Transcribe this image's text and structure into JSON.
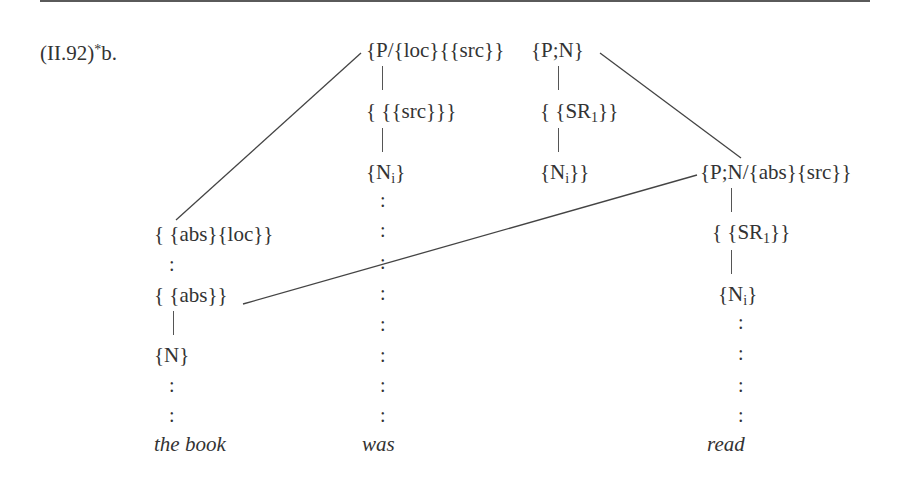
{
  "example": {
    "number": "(II.92)",
    "star": "*",
    "letter": "b."
  },
  "nodes": {
    "top_left": "{P/{loc}{{src}}",
    "top_right": "{P;N}",
    "was_mid": "{ {{src}}}",
    "was_low_base": "{N",
    "was_low_sub": "i",
    "was_low_close": "}",
    "pn_mid_base": "{ {SR",
    "pn_mid_sub": "1",
    "pn_mid_close": "}}",
    "pn_low_base": "{N",
    "pn_low_sub": "i",
    "pn_low_close": "}}",
    "read_top": "{P;N/{abs}{src}}",
    "read_mid_base": "{ {SR",
    "read_mid_sub": "1",
    "read_mid_close": "}}",
    "read_low_base": "{N",
    "read_low_sub": "i",
    "read_low_close": "}",
    "book_top": "{ {abs}{loc}}",
    "book_mid": "{ {abs}}",
    "book_low": "{N}"
  },
  "colon_glyph": ":",
  "words": {
    "the_book": "the book",
    "was": "was",
    "read": "read"
  }
}
